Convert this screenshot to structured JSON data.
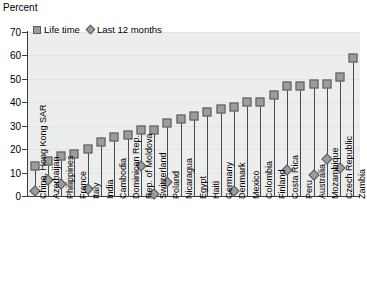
{
  "chart_data": {
    "type": "scatter",
    "title": "",
    "ylabel": "Percent",
    "xlabel": "",
    "ylim": [
      0,
      70
    ],
    "ytick_step": 10,
    "yticks": [
      0,
      10,
      20,
      30,
      40,
      50,
      60,
      70
    ],
    "grid": true,
    "legend_position": "top-left",
    "categories": [
      "China, Hong Kong SAR",
      "Azerbaijan",
      "Philippines",
      "France",
      "Italy",
      "India",
      "Cambodia",
      "Dominican Rep.",
      "Rep. of Moldova",
      "Switzerland",
      "Poland",
      "Nicaragua",
      "Egypt",
      "Haiti",
      "Germany",
      "Denmark",
      "Mexico",
      "Colombia",
      "Finland",
      "Costa Rica",
      "Peru",
      "Australia",
      "Mozambique",
      "Czech Republic",
      "Zambia"
    ],
    "series": [
      {
        "name": "Life time",
        "marker": "square",
        "color": "#9c9c9c",
        "values": [
          13,
          15,
          17,
          18,
          20,
          23,
          25,
          26,
          28,
          28,
          31,
          33,
          34,
          36,
          37,
          38,
          40,
          40,
          43,
          47,
          47,
          48,
          48,
          51,
          59
        ]
      },
      {
        "name": "Last 12 months",
        "marker": "diamond",
        "color": "#9c9c9c",
        "values": [
          2,
          7,
          5,
          null,
          3,
          null,
          null,
          null,
          13,
          1,
          6,
          null,
          null,
          null,
          null,
          2,
          null,
          null,
          null,
          11,
          null,
          9,
          16,
          12,
          null
        ]
      }
    ]
  },
  "legend": {
    "items": [
      {
        "label": "Life time",
        "marker": "square"
      },
      {
        "label": "Last 12 months",
        "marker": "diamond"
      }
    ]
  },
  "axes": {
    "y_title": "Percent"
  }
}
